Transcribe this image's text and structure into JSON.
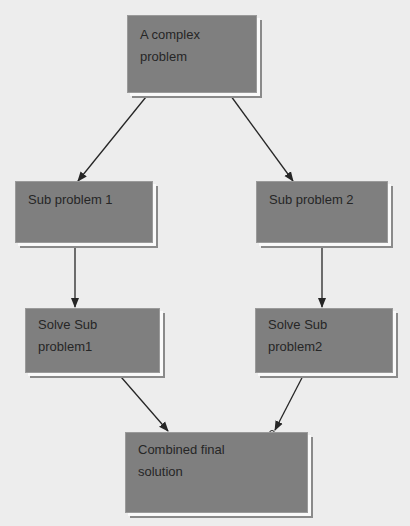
{
  "diagram": {
    "type": "flowchart",
    "colors": {
      "background": "#ededed",
      "node_fill": "#7f7f7f",
      "text": "#262626",
      "edge": "#262626"
    },
    "nodes": [
      {
        "id": "root",
        "label": "A complex problem",
        "line1": "A complex",
        "line2": "problem"
      },
      {
        "id": "sub1",
        "label": "Sub problem 1",
        "line1": "Sub problem 1",
        "line2": ""
      },
      {
        "id": "sub2",
        "label": "Sub problem 2",
        "line1": "Sub problem 2",
        "line2": ""
      },
      {
        "id": "solve1",
        "label": "Solve Sub problem1",
        "line1": "Solve Sub",
        "line2": "problem1"
      },
      {
        "id": "solve2",
        "label": "Solve Sub problem2",
        "line1": "Solve Sub",
        "line2": "problem2"
      },
      {
        "id": "combined",
        "label": "Combined final solution",
        "line1": "Combined final",
        "line2": "solution"
      }
    ],
    "edges": [
      {
        "from": "root",
        "to": "sub1"
      },
      {
        "from": "root",
        "to": "sub2"
      },
      {
        "from": "sub1",
        "to": "solve1"
      },
      {
        "from": "sub2",
        "to": "solve2"
      },
      {
        "from": "solve1",
        "to": "combined"
      },
      {
        "from": "solve2",
        "to": "combined"
      }
    ]
  }
}
